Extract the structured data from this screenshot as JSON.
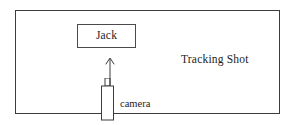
{
  "diagram": {
    "title": "Tracking Shot",
    "frame": {
      "border_color": "#3c3c3c",
      "background": "#ffffff"
    },
    "subject_box": {
      "label": "Jack",
      "border_color": "#4a4a4a"
    },
    "arrow": {
      "name": "up-arrow",
      "direction": "up",
      "color": "#3c3c3c"
    },
    "camera": {
      "label": "camera",
      "icon_name": "camera-icon",
      "color": "#3c3c3c"
    },
    "annotation": {
      "text": "Tracking Shot",
      "color": "#1d1d1d"
    }
  }
}
